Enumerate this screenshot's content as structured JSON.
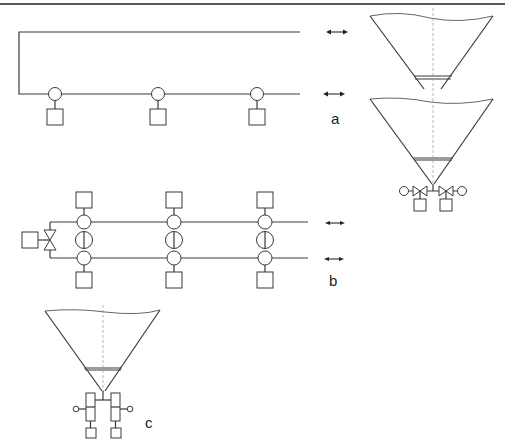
{
  "figure": {
    "panel_labels": {
      "a": "a",
      "b": "b",
      "c": "c"
    },
    "colors": {
      "line": "#3a3a3a",
      "centerline": "#999999",
      "background": "#ffffff"
    },
    "panels": [
      {
        "id": "a",
        "description": "Loop pipeline with three branch take-offs (circle + box), bidirectional flow arrows, two conical hoppers with outlet valves",
        "take_offs": 3,
        "flow_arrows": 2,
        "hoppers": 2
      },
      {
        "id": "b",
        "description": "Two parallel pipelines with three crossing manifolds (circle-valve-circle) and boxes above/below, shut-off valve with actuator box on the left",
        "manifolds": 3,
        "flow_arrows": 2
      },
      {
        "id": "c",
        "description": "Conical hopper with outlet feeding two rotary feeders with drives and boxes",
        "hoppers": 1,
        "feeders": 2
      }
    ]
  }
}
